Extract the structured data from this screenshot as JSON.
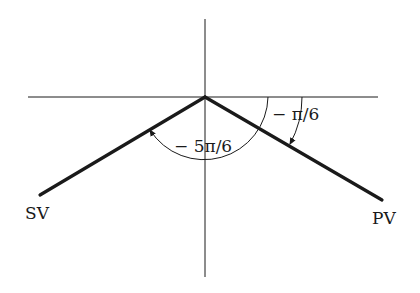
{
  "diagram": {
    "type": "phasor-angle-diagram",
    "origin": [
      205,
      97
    ],
    "axes": {
      "horizontal": {
        "x1": 28,
        "x2": 378,
        "y": 97
      },
      "vertical": {
        "x": 205,
        "y1": 19,
        "y2": 277
      }
    },
    "vectors": [
      {
        "id": "SV",
        "label": "SV",
        "end": [
          40,
          195
        ],
        "angle_label": "-5π/6"
      },
      {
        "id": "PV",
        "label": "PV",
        "end": [
          382,
          200
        ],
        "angle_label": "-π/6"
      }
    ],
    "angles": {
      "sv_angle": {
        "label": "− 5π/6",
        "radius": 64
      },
      "pv_angle": {
        "label": "− π/6",
        "radius": 97
      }
    },
    "colors": {
      "line": "#1a1a1a",
      "background": "#ffffff"
    }
  }
}
